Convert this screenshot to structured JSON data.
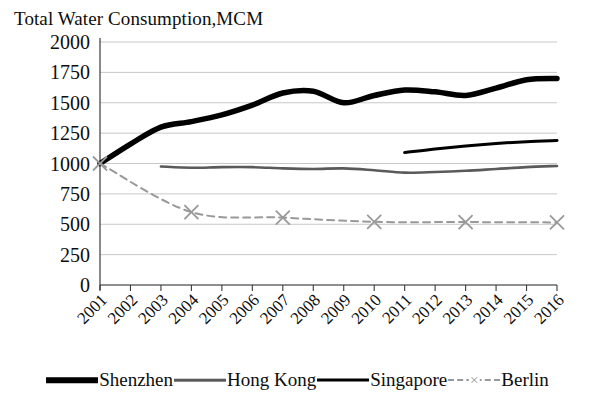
{
  "chart_data": {
    "type": "line",
    "title": "Total Water Consumption,MCM",
    "xlabel": "",
    "ylabel": "",
    "ylim": [
      0,
      2000
    ],
    "ytick_values": [
      0,
      250,
      500,
      750,
      1000,
      1250,
      1500,
      1750,
      2000
    ],
    "ytick_labels": [
      "0",
      "250",
      "500",
      "750",
      "1000",
      "1250",
      "1500",
      "1750",
      "2000"
    ],
    "grid": true,
    "legend_position": "bottom",
    "categories": [
      "2001",
      "2002",
      "2003",
      "2004",
      "2005",
      "2006",
      "2007",
      "2008",
      "2009",
      "2010",
      "2011",
      "2012",
      "2013",
      "2014",
      "2015",
      "2016"
    ],
    "series": [
      {
        "name": "Shenzhen",
        "color": "#000000",
        "style": "solid-thick",
        "marker": "none",
        "x": [
          "2001",
          "2002",
          "2003",
          "2004",
          "2005",
          "2006",
          "2007",
          "2008",
          "2009",
          "2010",
          "2011",
          "2012",
          "2013",
          "2014",
          "2015",
          "2016"
        ],
        "values": [
          1000,
          1160,
          1300,
          1345,
          1400,
          1480,
          1580,
          1595,
          1500,
          1560,
          1605,
          1590,
          1560,
          1620,
          1690,
          1700
        ]
      },
      {
        "name": "Hong Kong",
        "color": "#5a5a5a",
        "style": "solid-medium",
        "marker": "none",
        "x": [
          "2003",
          "2004",
          "2005",
          "2006",
          "2007",
          "2008",
          "2009",
          "2010",
          "2011",
          "2012",
          "2013",
          "2014",
          "2015",
          "2016"
        ],
        "values": [
          975,
          965,
          970,
          970,
          960,
          955,
          960,
          945,
          925,
          930,
          940,
          955,
          970,
          980
        ]
      },
      {
        "name": "Singapore",
        "color": "#000000",
        "style": "solid-thin",
        "marker": "none",
        "x": [
          "2011",
          "2012",
          "2013",
          "2014",
          "2015",
          "2016"
        ],
        "values": [
          1090,
          1120,
          1145,
          1165,
          1180,
          1190
        ]
      },
      {
        "name": "Berlin",
        "color": "#999999",
        "style": "dashed",
        "marker": "x",
        "x": [
          "2001",
          "2004",
          "2007",
          "2010",
          "2013",
          "2016"
        ],
        "values": [
          1000,
          600,
          555,
          520,
          518,
          515
        ]
      }
    ]
  },
  "legend": {
    "entries": [
      {
        "label": "Shenzhen",
        "color": "#000000",
        "style": "solid-thick",
        "marker": "none"
      },
      {
        "label": "Hong Kong",
        "color": "#5a5a5a",
        "style": "solid-medium",
        "marker": "none"
      },
      {
        "label": "Singapore",
        "color": "#000000",
        "style": "solid-thin",
        "marker": "none"
      },
      {
        "label": "Berlin",
        "color": "#999999",
        "style": "dashed",
        "marker": "x"
      }
    ]
  },
  "colors": {
    "background": "#ffffff",
    "axis": "#3a3a3a",
    "grid": "#c8c8c8",
    "text": "#0d0d0d"
  }
}
